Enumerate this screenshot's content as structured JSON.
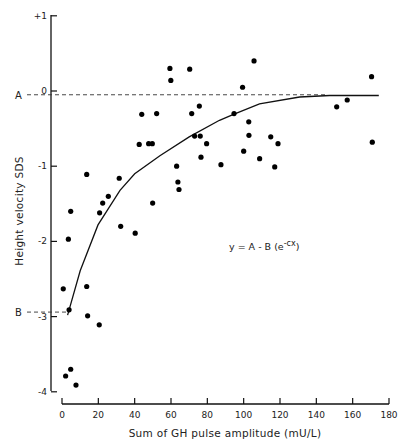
{
  "chart_data": {
    "type": "scatter",
    "title": "",
    "xlabel": "Sum of GH pulse amplitude (mU/L)",
    "ylabel": "Height velocity SDS",
    "xlim": [
      0,
      180
    ],
    "ylim": [
      -4,
      1
    ],
    "x_ticks": [
      0,
      20,
      40,
      60,
      80,
      100,
      120,
      140,
      160,
      180
    ],
    "y_ticks": [
      1,
      0,
      -1,
      -2,
      -3,
      -4
    ],
    "y_tick_labels": [
      "+1",
      "0",
      "-1",
      "-2",
      "-3",
      "-4"
    ],
    "grid": false,
    "legend": null,
    "annotations": [
      {
        "text": "y = A - B (e",
        "superscript": "-cx",
        "suffix": ")",
        "x": 105,
        "y": -2.05
      },
      {
        "text": "A",
        "y": -0.05,
        "kind": "reference-line-label"
      },
      {
        "text": "B",
        "y": -2.94,
        "kind": "reference-line-label"
      }
    ],
    "reference_lines": [
      {
        "label": "A",
        "y": -0.05,
        "x_end": 146,
        "style": "dashed"
      },
      {
        "label": "B",
        "y": -2.94,
        "x_end": 4,
        "style": "dashed"
      }
    ],
    "series": [
      {
        "name": "observations",
        "kind": "scatter",
        "points": [
          [
            0.7,
            -2.63
          ],
          [
            3.5,
            -1.97
          ],
          [
            4.8,
            -1.6
          ],
          [
            3.9,
            -2.91
          ],
          [
            4.8,
            -3.7
          ],
          [
            2.0,
            -3.79
          ],
          [
            7.7,
            -3.91
          ],
          [
            13.6,
            -1.11
          ],
          [
            13.6,
            -2.6
          ],
          [
            14.1,
            -2.99
          ],
          [
            20.5,
            -3.11
          ],
          [
            20.7,
            -1.62
          ],
          [
            22.4,
            -1.49
          ],
          [
            25.5,
            -1.4
          ],
          [
            31.5,
            -1.16
          ],
          [
            32.3,
            -1.8
          ],
          [
            40.3,
            -1.89
          ],
          [
            42.5,
            -0.71
          ],
          [
            43.9,
            -0.31
          ],
          [
            47.7,
            -0.7
          ],
          [
            49.7,
            -0.7
          ],
          [
            49.9,
            -1.49
          ],
          [
            52.1,
            -0.3
          ],
          [
            59.4,
            0.3
          ],
          [
            59.9,
            0.14
          ],
          [
            63.1,
            -1.0
          ],
          [
            63.8,
            -1.21
          ],
          [
            64.4,
            -1.31
          ],
          [
            70.3,
            0.29
          ],
          [
            71.4,
            -0.3
          ],
          [
            73.0,
            -0.6
          ],
          [
            75.6,
            -0.2
          ],
          [
            76.1,
            -0.6
          ],
          [
            76.5,
            -0.88
          ],
          [
            79.6,
            -0.7
          ],
          [
            87.5,
            -0.98
          ],
          [
            94.7,
            -0.3
          ],
          [
            99.4,
            0.05
          ],
          [
            100.0,
            -0.8
          ],
          [
            102.8,
            -0.41
          ],
          [
            102.9,
            -0.59
          ],
          [
            105.7,
            0.4
          ],
          [
            108.8,
            -0.9
          ],
          [
            114.9,
            -0.61
          ],
          [
            117.1,
            -1.01
          ],
          [
            118.9,
            -0.7
          ],
          [
            151.2,
            -0.21
          ],
          [
            157.0,
            -0.12
          ],
          [
            170.4,
            0.19
          ],
          [
            170.8,
            -0.68
          ]
        ]
      },
      {
        "name": "fitted curve y = A - B(e^-cx)",
        "kind": "line",
        "points": [
          [
            3.1,
            -2.98
          ],
          [
            10.0,
            -2.39
          ],
          [
            19.8,
            -1.78
          ],
          [
            31.9,
            -1.32
          ],
          [
            40.0,
            -1.1
          ],
          [
            53.9,
            -0.86
          ],
          [
            70.0,
            -0.61
          ],
          [
            86.7,
            -0.39
          ],
          [
            94.4,
            -0.31
          ],
          [
            108.7,
            -0.17
          ],
          [
            130.8,
            -0.08
          ],
          [
            147.3,
            -0.06
          ],
          [
            174.4,
            -0.06
          ]
        ]
      }
    ]
  },
  "axes": {
    "ylabel": "Height velocity SDS",
    "xlabel": "Sum of GH pulse amplitude (mU/L)",
    "equation_main": "y = A - B (e",
    "equation_sup": "-cx",
    "equation_end": ")",
    "label_A": "A",
    "label_B": "B"
  }
}
